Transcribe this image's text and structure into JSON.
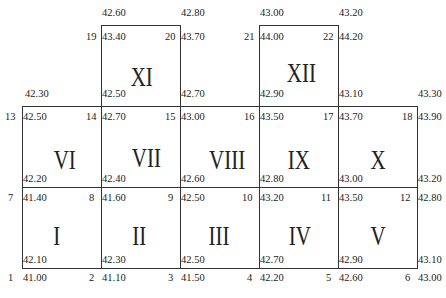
{
  "cells": [
    {
      "id": "I",
      "x": 22,
      "y": 187,
      "w": 79,
      "h": 81
    },
    {
      "id": "II",
      "x": 101,
      "y": 187,
      "w": 79,
      "h": 81
    },
    {
      "id": "III",
      "x": 180,
      "y": 187,
      "w": 79,
      "h": 81
    },
    {
      "id": "IV",
      "x": 259,
      "y": 187,
      "w": 79,
      "h": 81
    },
    {
      "id": "V",
      "x": 338,
      "y": 187,
      "w": 79,
      "h": 81
    },
    {
      "id": "VI",
      "x": 22,
      "y": 106,
      "w": 79,
      "h": 81
    },
    {
      "id": "VII",
      "x": 101,
      "y": 106,
      "w": 79,
      "h": 81
    },
    {
      "id": "VIII",
      "x": 180,
      "y": 106,
      "w": 79,
      "h": 81
    },
    {
      "id": "IX",
      "x": 259,
      "y": 106,
      "w": 79,
      "h": 81
    },
    {
      "id": "X",
      "x": 338,
      "y": 106,
      "w": 79,
      "h": 81
    },
    {
      "id": "XI",
      "x": 101,
      "y": 25,
      "w": 79,
      "h": 81
    },
    {
      "id": "XII",
      "x": 259,
      "y": 25,
      "w": 79,
      "h": 81
    }
  ],
  "roman_labels": [
    {
      "text": "I",
      "x": 52,
      "y": 222
    },
    {
      "text": "II",
      "x": 130,
      "y": 222
    },
    {
      "text": "III",
      "x": 205,
      "y": 222
    },
    {
      "text": "IV",
      "x": 285,
      "y": 222
    },
    {
      "text": "V",
      "x": 368,
      "y": 222
    },
    {
      "text": "VI",
      "x": 50,
      "y": 146
    },
    {
      "text": "VII",
      "x": 127,
      "y": 144
    },
    {
      "text": "VIII",
      "x": 203,
      "y": 146
    },
    {
      "text": "IX",
      "x": 284,
      "y": 146
    },
    {
      "text": "X",
      "x": 368,
      "y": 146
    },
    {
      "text": "XI",
      "x": 127,
      "y": 63
    },
    {
      "text": "XII",
      "x": 282,
      "y": 59
    }
  ],
  "corner_numbers": [
    {
      "text": "1",
      "x": 8,
      "y": 272
    },
    {
      "text": "2",
      "x": 89,
      "y": 272
    },
    {
      "text": "3",
      "x": 168,
      "y": 272
    },
    {
      "text": "4",
      "x": 247,
      "y": 272
    },
    {
      "text": "5",
      "x": 326,
      "y": 272
    },
    {
      "text": "6",
      "x": 405,
      "y": 272
    },
    {
      "text": "7",
      "x": 8,
      "y": 192
    },
    {
      "text": "8",
      "x": 89,
      "y": 192
    },
    {
      "text": "9",
      "x": 168,
      "y": 192
    },
    {
      "text": "10",
      "x": 242,
      "y": 192
    },
    {
      "text": "11",
      "x": 321,
      "y": 192
    },
    {
      "text": "12",
      "x": 400,
      "y": 192
    },
    {
      "text": "13",
      "x": 5,
      "y": 111
    },
    {
      "text": "14",
      "x": 86,
      "y": 111
    },
    {
      "text": "15",
      "x": 165,
      "y": 111
    },
    {
      "text": "16",
      "x": 244,
      "y": 111
    },
    {
      "text": "17",
      "x": 323,
      "y": 111
    },
    {
      "text": "18",
      "x": 402,
      "y": 111
    },
    {
      "text": "19",
      "x": 86,
      "y": 31
    },
    {
      "text": "20",
      "x": 165,
      "y": 31
    },
    {
      "text": "21",
      "x": 244,
      "y": 31
    },
    {
      "text": "22",
      "x": 323,
      "y": 31
    }
  ],
  "elevations": [
    {
      "text": "41.00",
      "x": 23,
      "y": 272
    },
    {
      "text": "41.10",
      "x": 102,
      "y": 272
    },
    {
      "text": "41.50",
      "x": 181,
      "y": 272
    },
    {
      "text": "42.20",
      "x": 260,
      "y": 272
    },
    {
      "text": "42.60",
      "x": 339,
      "y": 272
    },
    {
      "text": "43.00",
      "x": 418,
      "y": 272
    },
    {
      "text": "42.10",
      "x": 23,
      "y": 254
    },
    {
      "text": "42.30",
      "x": 102,
      "y": 254
    },
    {
      "text": "42.50",
      "x": 181,
      "y": 254
    },
    {
      "text": "42.70",
      "x": 260,
      "y": 254
    },
    {
      "text": "42.90",
      "x": 339,
      "y": 254
    },
    {
      "text": "43.10",
      "x": 418,
      "y": 254
    },
    {
      "text": "41.40",
      "x": 23,
      "y": 192
    },
    {
      "text": "41.60",
      "x": 102,
      "y": 192
    },
    {
      "text": "42.50",
      "x": 181,
      "y": 192
    },
    {
      "text": "43.20",
      "x": 260,
      "y": 192
    },
    {
      "text": "43.50",
      "x": 339,
      "y": 192
    },
    {
      "text": "42.80",
      "x": 418,
      "y": 192
    },
    {
      "text": "42.20",
      "x": 23,
      "y": 173
    },
    {
      "text": "42.40",
      "x": 102,
      "y": 173
    },
    {
      "text": "42.60",
      "x": 181,
      "y": 173
    },
    {
      "text": "42.80",
      "x": 260,
      "y": 173
    },
    {
      "text": "43.00",
      "x": 339,
      "y": 173
    },
    {
      "text": "43.20",
      "x": 418,
      "y": 173
    },
    {
      "text": "42.50",
      "x": 23,
      "y": 111
    },
    {
      "text": "42.70",
      "x": 102,
      "y": 111
    },
    {
      "text": "43.00",
      "x": 181,
      "y": 111
    },
    {
      "text": "43.50",
      "x": 260,
      "y": 111
    },
    {
      "text": "43.70",
      "x": 339,
      "y": 111
    },
    {
      "text": "43.90",
      "x": 418,
      "y": 111
    },
    {
      "text": "42.30",
      "x": 25,
      "y": 88
    },
    {
      "text": "42.50",
      "x": 102,
      "y": 88
    },
    {
      "text": "42.70",
      "x": 181,
      "y": 88
    },
    {
      "text": "42.90",
      "x": 260,
      "y": 88
    },
    {
      "text": "43.10",
      "x": 339,
      "y": 88
    },
    {
      "text": "43.30",
      "x": 418,
      "y": 88
    },
    {
      "text": "43.40",
      "x": 102,
      "y": 31
    },
    {
      "text": "43.70",
      "x": 181,
      "y": 31
    },
    {
      "text": "44.00",
      "x": 260,
      "y": 31
    },
    {
      "text": "44.20",
      "x": 339,
      "y": 31
    },
    {
      "text": "42.60",
      "x": 102,
      "y": 7
    },
    {
      "text": "42.80",
      "x": 181,
      "y": 7
    },
    {
      "text": "43.00",
      "x": 260,
      "y": 7
    },
    {
      "text": "43.20",
      "x": 339,
      "y": 7
    }
  ]
}
